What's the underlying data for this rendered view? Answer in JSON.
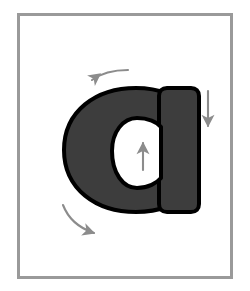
{
  "figure": {
    "background_color": "#ffffff",
    "frame": {
      "name": "outer-frame",
      "border_color": "#9a9a9a",
      "border_width_px": 3,
      "inner_fill": "#ffffff"
    }
  },
  "glyph": {
    "character": "a",
    "script": "latin",
    "case": "lowercase",
    "style": "geometric-sans-bold",
    "fill_color": "#3d3d3d",
    "outline_color": "#000000",
    "outline_width_px": 4,
    "counter_fill": "#ffffff",
    "parts": [
      {
        "name": "bowl",
        "description": "round closed bowl on the left"
      },
      {
        "name": "stem",
        "description": "straight vertical stem on the right"
      },
      {
        "name": "counter",
        "description": "white oval enclosed by the bowl"
      }
    ]
  },
  "arrows": {
    "color": "#8c8c8c",
    "items": [
      {
        "id": "arrow-bowl-top",
        "label": "bowl top stroke direction",
        "shape": "curved",
        "direction": "counterclockwise-left",
        "head_points": "left"
      },
      {
        "id": "arrow-bowl-bottom",
        "label": "bowl bottom stroke direction",
        "shape": "curved",
        "direction": "counterclockwise-right",
        "head_points": "right"
      },
      {
        "id": "arrow-stem-down",
        "label": "stem stroke direction",
        "shape": "straight",
        "direction": "down",
        "head_points": "down"
      },
      {
        "id": "arrow-counter-up",
        "label": "counter stroke direction",
        "shape": "straight",
        "direction": "up",
        "head_points": "up"
      }
    ]
  }
}
